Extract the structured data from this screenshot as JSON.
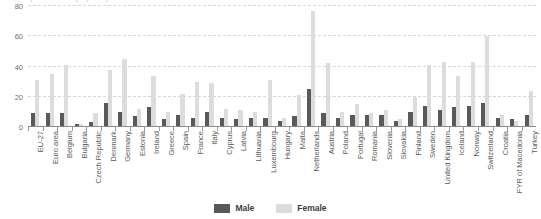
{
  "chart_data": {
    "type": "bar",
    "title": "(% of total employment)",
    "xlabel": "",
    "ylabel": "",
    "ylim": [
      0,
      80
    ],
    "yticks": [
      0,
      20,
      40,
      60,
      80
    ],
    "grid": true,
    "legend_position": "bottom",
    "categories": [
      "EU-27",
      "Euro area",
      "Belgium",
      "Bulgaria",
      "Czech Republic",
      "Denmark",
      "Germany",
      "Estonia",
      "Ireland",
      "Greece",
      "Spain",
      "France",
      "Italy",
      "Cyprus",
      "Latvia",
      "Lithuania",
      "Luxembourg",
      "Hungary",
      "Malta",
      "Netherlands",
      "Austria",
      "Poland",
      "Portugal",
      "Romania",
      "Slovenia",
      "Slovakia",
      "Finland",
      "Sweden",
      "United Kingdom",
      "Iceland",
      "Norway",
      "Switzerland",
      "Croatia",
      "FYR of Macedonia",
      "Turkey"
    ],
    "series": [
      {
        "name": "Male",
        "color": "#595959",
        "values": [
          9,
          9,
          9,
          2,
          3,
          16,
          10,
          7,
          13,
          5,
          8,
          6,
          10,
          6,
          5,
          6,
          6,
          4,
          7,
          25,
          9,
          6,
          8,
          8,
          8,
          4,
          10,
          14,
          11,
          13,
          14,
          16,
          6,
          5,
          8
        ]
      },
      {
        "name": "Female",
        "color": "#dcdcdc",
        "values": [
          31,
          35,
          41,
          2,
          9,
          38,
          45,
          12,
          34,
          10,
          22,
          30,
          29,
          12,
          11,
          10,
          31,
          6,
          21,
          77,
          42,
          10,
          15,
          9,
          11,
          5,
          20,
          41,
          43,
          34,
          43,
          60,
          8,
          4,
          24
        ]
      }
    ]
  },
  "legend": {
    "items": [
      {
        "label": "Male"
      },
      {
        "label": "Female"
      }
    ]
  }
}
